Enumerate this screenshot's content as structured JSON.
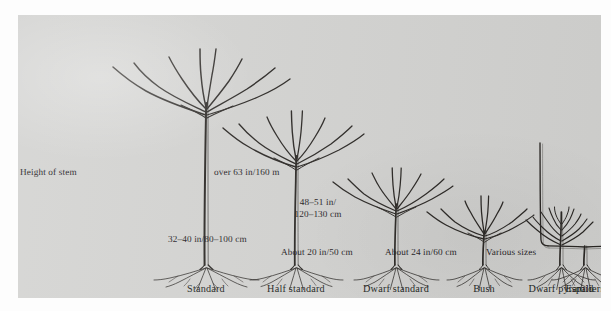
{
  "figure": {
    "kind": "botanical-diagram",
    "plate_background": "#d3d3d1",
    "ink_color": "#2a2724"
  },
  "row_label": {
    "text": "Height of stem"
  },
  "forms": [
    {
      "id": "standard",
      "caption": "Standard",
      "measure": "over 63 in/160 m",
      "measure_lines": [
        "over 63 in/160 m"
      ]
    },
    {
      "id": "half-standard",
      "caption": "Half standard",
      "measure": "48–51 in/ 120–130 cm",
      "measure_lines": [
        "48–51 in/",
        "120–130 cm"
      ]
    },
    {
      "id": "dwarf-standard",
      "caption": "Dwarf standard",
      "measure": "32–40 in/80–100 cm",
      "measure_lines": [
        "32–40 in/80–100 cm"
      ]
    },
    {
      "id": "bush",
      "caption": "Bush",
      "measure": "About 20 in/50 cm",
      "measure_lines": [
        "About 20 in/50 cm"
      ]
    },
    {
      "id": "dwarf-pyramid",
      "caption": "Dwarf pyramid",
      "measure": "About 24 in/60 cm",
      "measure_lines": [
        "About 24 in/60 cm"
      ]
    },
    {
      "id": "espaliers",
      "caption": "Espaliers",
      "measure": "Various sizes",
      "measure_lines": [
        "Various sizes"
      ]
    }
  ],
  "chart_data": {
    "type": "bar",
    "xlabel": "",
    "ylabel": "Height of stem",
    "categories": [
      "Standard",
      "Half standard",
      "Dwarf standard",
      "Bush",
      "Dwarf pyramid",
      "Espaliers"
    ],
    "value_labels": [
      "over 63 in/160 m",
      "48–51 in/120–130 cm",
      "32–40 in/80–100 cm",
      "About 20 in/50 cm",
      "About 24 in/60 cm",
      "Various sizes"
    ],
    "values_cm": [
      160,
      125,
      90,
      50,
      60,
      null
    ],
    "values_in": [
      63,
      49.5,
      36,
      20,
      24,
      null
    ],
    "units": "cm",
    "grid": false,
    "legend": false
  }
}
